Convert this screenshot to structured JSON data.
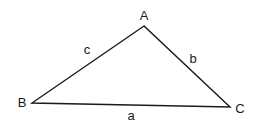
{
  "diagram": {
    "type": "triangle",
    "vertices": {
      "A": {
        "label": "A",
        "x": 144,
        "y": 26
      },
      "B": {
        "label": "B",
        "x": 32,
        "y": 103
      },
      "C": {
        "label": "C",
        "x": 230,
        "y": 107
      }
    },
    "sides": {
      "a": {
        "label": "a",
        "from": "B",
        "to": "C"
      },
      "b": {
        "label": "b",
        "from": "A",
        "to": "C"
      },
      "c": {
        "label": "c",
        "from": "A",
        "to": "B"
      }
    },
    "stroke_color": "#1a1a1a",
    "background": "#ffffff"
  }
}
